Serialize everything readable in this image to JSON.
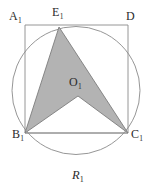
{
  "figure": {
    "name": "circle-inscribed-square-with-shaded-arrow",
    "width": 151,
    "height": 189,
    "background_color": "#ffffff",
    "caption": {
      "text": "R",
      "subscript": "1"
    },
    "labels": [
      {
        "id": "A1",
        "text": "A",
        "subscript": "1",
        "x": 9,
        "y": 10
      },
      {
        "id": "E1",
        "text": "E",
        "subscript": "1",
        "x": 52,
        "y": 6
      },
      {
        "id": "D",
        "text": "D",
        "subscript": "",
        "x": 126,
        "y": 10
      },
      {
        "id": "O1",
        "text": "O",
        "subscript": "1",
        "x": 69,
        "y": 76
      },
      {
        "id": "B1",
        "text": "B",
        "subscript": "1",
        "x": 12,
        "y": 128
      },
      {
        "id": "C1",
        "text": "C",
        "subscript": "1",
        "x": 131,
        "y": 128
      }
    ],
    "circle": {
      "cx": 76.0,
      "cy": 90.5,
      "r": 64.0,
      "stroke_color": "#8a8a8a",
      "stroke_width": 0.9,
      "fill": "none"
    },
    "square": {
      "points": "25,25 128,25 128,133 25,133",
      "stroke_color": "#8a8a8a",
      "stroke_width": 0.9,
      "fill": "none",
      "vertices": {
        "top_left": "A1",
        "top_right": "D",
        "bottom_right": "C1",
        "bottom_left": "B1"
      }
    },
    "shaded_polygon": {
      "points": "59,27 128,133 78,96 25,133",
      "fill_color": "#b3b3b3",
      "stroke_color": "#7d7d7d",
      "stroke_width": 0.9,
      "vertex_order": [
        "E1",
        "C1",
        "O1",
        "B1"
      ]
    },
    "base_segment": {
      "points": "25,133 128,133",
      "stroke_color": "#8a8a8a",
      "stroke_width": 0.9
    }
  },
  "chart_data": {
    "type": "diagram",
    "title": "R1",
    "elements": [
      {
        "kind": "circle",
        "center": [
          76.0,
          90.5
        ],
        "radius": 64.0
      },
      {
        "kind": "square",
        "vertices": [
          [
            25,
            25
          ],
          [
            128,
            25
          ],
          [
            128,
            133
          ],
          [
            25,
            133
          ]
        ],
        "labels": [
          "A1",
          "D",
          "C1",
          "B1"
        ]
      },
      {
        "kind": "point",
        "label": "E1",
        "position": [
          59,
          27
        ]
      },
      {
        "kind": "point",
        "label": "O1",
        "position": [
          78,
          96
        ]
      },
      {
        "kind": "polygon",
        "label": "shaded-arrow",
        "vertices": [
          [
            59,
            27
          ],
          [
            128,
            133
          ],
          [
            78,
            96
          ],
          [
            25,
            133
          ]
        ],
        "fill": "#b3b3b3"
      }
    ]
  }
}
